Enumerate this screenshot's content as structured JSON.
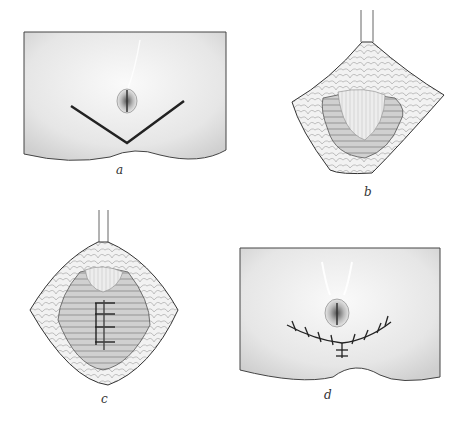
{
  "figure": {
    "panels": [
      {
        "id": "a",
        "label": "a",
        "description": "Abdominal skin with umbilicus and V-shaped incision line below"
      },
      {
        "id": "b",
        "label": "b",
        "description": "Retracted diamond-shaped flap exposing fascia and rectus muscles"
      },
      {
        "id": "c",
        "label": "c",
        "description": "Muscle plication with interrupted sutures along midline"
      },
      {
        "id": "d",
        "label": "d",
        "description": "Closed skin with sutured Y-shaped incision below umbilicus"
      }
    ]
  }
}
